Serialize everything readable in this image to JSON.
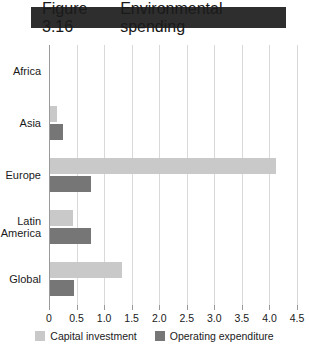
{
  "banner": {
    "figure_number": "Figure 3.16",
    "title": "Environmental spending"
  },
  "colors": {
    "banner_background": "#2e2e2e",
    "banner_text": "#ffffff",
    "capital_investment": "#c9c9c9",
    "operating_expenditure": "#767676",
    "gridline": "#d9d9d9",
    "axis": "#9a9a9a"
  },
  "chart_data": {
    "type": "bar",
    "orientation": "horizontal",
    "title": "Environmental spending",
    "figure_label": "Figure 3.16",
    "xlabel": "",
    "ylabel": "",
    "xlim": [
      0,
      4.5
    ],
    "grid": true,
    "legend_position": "bottom",
    "categories": [
      "Africa",
      "Asia",
      "Europe",
      "Latin America",
      "Global"
    ],
    "tick_labels": [
      "0",
      "0.5",
      "1.0",
      "1.5",
      "2.0",
      "2.5",
      "3.0",
      "3.5",
      "4.0",
      "4.5"
    ],
    "tick_values": [
      0,
      0.5,
      1.0,
      1.5,
      2.0,
      2.5,
      3.0,
      3.5,
      4.0,
      4.5
    ],
    "series": [
      {
        "name": "Capital investment",
        "color": "#c9c9c9",
        "values": [
          0.0,
          0.13,
          4.1,
          0.42,
          1.31
        ]
      },
      {
        "name": "Operating expenditure",
        "color": "#767676",
        "values": [
          0.0,
          0.24,
          0.75,
          0.75,
          0.44
        ]
      }
    ]
  }
}
